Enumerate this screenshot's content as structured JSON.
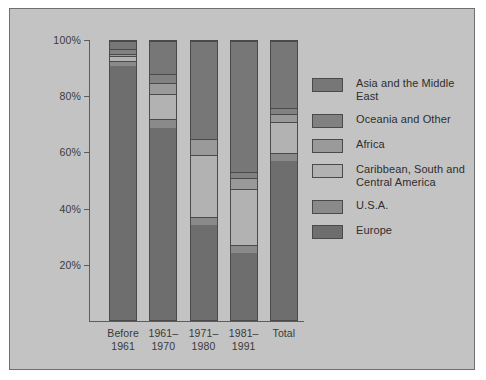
{
  "figure": {
    "background_color": "#ffffff",
    "panel_color": "#c3c3c3",
    "panel_border_color": "#6f6f6f",
    "axis_color": "#5d5d5d"
  },
  "chart_data": {
    "type": "bar",
    "stacked": true,
    "normalized_percent": true,
    "title": "",
    "subtitle": "",
    "xlabel": "",
    "ylabel": "",
    "grid": false,
    "legend_position": "right",
    "ylim": [
      0,
      100
    ],
    "yticks": [
      20,
      40,
      60,
      80,
      100
    ],
    "ytick_labels": [
      "20%",
      "40%",
      "60%",
      "80%",
      "100%"
    ],
    "categories": [
      "Before\n1961",
      "1961–\n1970",
      "1971–\n1980",
      "1981–\n1991",
      "Total"
    ],
    "series": [
      {
        "name": "Europe",
        "color": "#6e6e6e",
        "values": [
          91,
          69,
          34,
          24,
          57
        ]
      },
      {
        "name": "U.S.A.",
        "color": "#8a8a8a",
        "values": [
          2,
          3,
          3,
          3,
          3
        ]
      },
      {
        "name": "Caribbean, South and\nCentral America",
        "color": "#b2b2b2",
        "values": [
          1.5,
          9,
          22,
          20,
          11
        ]
      },
      {
        "name": "Africa",
        "color": "#9a9a9a",
        "values": [
          1,
          4,
          6,
          4,
          3
        ]
      },
      {
        "name": "Oceania and Other",
        "color": "#818181",
        "values": [
          1.5,
          3,
          0,
          2,
          2
        ]
      },
      {
        "name": "Asia and the Middle East",
        "color": "#777777",
        "values": [
          3,
          12,
          35,
          47,
          24
        ]
      }
    ]
  },
  "legend": {
    "items": [
      {
        "label": "Asia and the Middle East",
        "color": "#777777"
      },
      {
        "label": "Oceania and Other",
        "color": "#818181"
      },
      {
        "label": "Africa",
        "color": "#9a9a9a"
      },
      {
        "label": "Caribbean, South and\nCentral America",
        "color": "#b2b2b2"
      },
      {
        "label": "U.S.A.",
        "color": "#8a8a8a"
      },
      {
        "label": "Europe",
        "color": "#6e6e6e"
      }
    ]
  }
}
